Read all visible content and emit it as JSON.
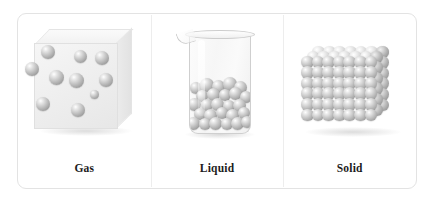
{
  "figure": {
    "panels": [
      {
        "id": "gas",
        "caption": "Gas",
        "illustration": "transparent-cube-with-dispersed-spheres",
        "particle_count": 10,
        "particles": [
          {
            "x": 30,
            "y": 38,
            "r": 7
          },
          {
            "x": 14,
            "y": 55,
            "r": 7
          },
          {
            "x": 62,
            "y": 42,
            "r": 6.5
          },
          {
            "x": 84,
            "y": 44,
            "r": 7
          },
          {
            "x": 38,
            "y": 63,
            "r": 7.5
          },
          {
            "x": 58,
            "y": 66,
            "r": 7.5
          },
          {
            "x": 88,
            "y": 66,
            "r": 7
          },
          {
            "x": 25,
            "y": 90,
            "r": 7
          },
          {
            "x": 60,
            "y": 96,
            "r": 7
          },
          {
            "x": 76,
            "y": 80,
            "r": 4.5
          }
        ]
      },
      {
        "id": "liquid",
        "caption": "Liquid",
        "illustration": "beaker-with-packed-spheres",
        "fill_level_percent": 55,
        "particles": [
          {
            "x": 3,
            "y": 6,
            "r": 6
          },
          {
            "x": 14,
            "y": 2,
            "r": 7
          },
          {
            "x": 26,
            "y": 4,
            "r": 6.5
          },
          {
            "x": 37,
            "y": 1,
            "r": 7
          },
          {
            "x": 48,
            "y": 5,
            "r": 6.5
          },
          {
            "x": 9,
            "y": 14,
            "r": 6
          },
          {
            "x": 21,
            "y": 12,
            "r": 6.5
          },
          {
            "x": 32,
            "y": 13,
            "r": 6
          },
          {
            "x": 43,
            "y": 11,
            "r": 6.5
          },
          {
            "x": 53,
            "y": 15,
            "r": 6
          },
          {
            "x": 2,
            "y": 22,
            "r": 6.5
          },
          {
            "x": 14,
            "y": 23,
            "r": 6
          },
          {
            "x": 25,
            "y": 22,
            "r": 6.5
          },
          {
            "x": 36,
            "y": 24,
            "r": 6
          },
          {
            "x": 47,
            "y": 23,
            "r": 6.5
          },
          {
            "x": 7,
            "y": 32,
            "r": 6
          },
          {
            "x": 18,
            "y": 33,
            "r": 6.5
          },
          {
            "x": 29,
            "y": 31,
            "r": 6
          },
          {
            "x": 40,
            "y": 33,
            "r": 6.5
          },
          {
            "x": 51,
            "y": 31,
            "r": 6
          },
          {
            "x": 1,
            "y": 41,
            "r": 6.5
          },
          {
            "x": 12,
            "y": 42,
            "r": 6
          },
          {
            "x": 23,
            "y": 41,
            "r": 6.5
          },
          {
            "x": 34,
            "y": 42,
            "r": 6
          },
          {
            "x": 45,
            "y": 41,
            "r": 6.5
          },
          {
            "x": 54,
            "y": 40,
            "r": 6
          }
        ]
      },
      {
        "id": "solid",
        "caption": "Solid",
        "illustration": "cubic-crystal-lattice",
        "lattice": {
          "columns": 7,
          "rows": 6,
          "depth": 3
        }
      }
    ]
  }
}
